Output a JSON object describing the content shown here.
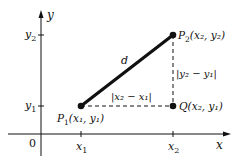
{
  "diagram": {
    "colors": {
      "ink": "#111111",
      "background": "#ffffff"
    },
    "axes": {
      "x_label": "x",
      "y_label": "y",
      "origin_label": "0",
      "x_ticks": [
        {
          "main": "x",
          "sub": "1"
        },
        {
          "main": "x",
          "sub": "2"
        }
      ],
      "y_ticks": [
        {
          "main": "y",
          "sub": "2"
        },
        {
          "main": "y",
          "sub": "1"
        }
      ]
    },
    "points": {
      "p1": {
        "name": "P",
        "sub": "1",
        "coords": "(x₁, y₁)"
      },
      "p2": {
        "name": "P",
        "sub": "2",
        "coords": "(x₂, y₂)"
      },
      "q": {
        "name": "Q",
        "coords": "(x₂, y₁)"
      }
    },
    "segment_label": "d",
    "horizontal_label": "|x₂ − x₁|",
    "vertical_label": "|y₂ − y₁|"
  }
}
